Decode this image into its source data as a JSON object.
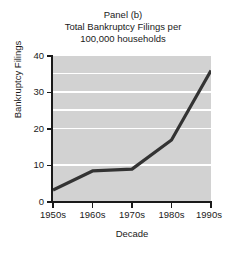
{
  "chart_data": {
    "type": "line",
    "title": "Panel (b)\nTotal Bankruptcy Filings per\n100,000 households",
    "title_lines": [
      "Panel (b)",
      "Total Bankruptcy Filings per",
      "100,000 households"
    ],
    "xlabel": "Decade",
    "ylabel": "Bankruptcy Filings",
    "categories": [
      "1950s",
      "1960s",
      "1970s",
      "1980s",
      "1990s"
    ],
    "values": [
      3.3,
      8.5,
      9.0,
      17.0,
      36.0
    ],
    "series": [
      {
        "name": "Total Bankruptcy Filings per 100,000 households",
        "values": [
          3.3,
          8.5,
          9.0,
          17.0,
          36.0
        ]
      }
    ],
    "ylim": [
      0,
      40
    ],
    "yticks": [
      0,
      10,
      20,
      30,
      40
    ],
    "ytick_labels": [
      "0",
      "10",
      "20",
      "30",
      "40"
    ],
    "xtick_labels": [
      "1950s",
      "1960s",
      "1970s",
      "1980s",
      "1990s"
    ],
    "grid": true,
    "grid_axis": "y",
    "grid_color": "#ffffff",
    "legend": false,
    "legend_position": "none",
    "plot_background": "#d2d2d2",
    "figure_background": "#ffffff",
    "line_color": "#333333",
    "line_width": 3,
    "markers": false
  }
}
